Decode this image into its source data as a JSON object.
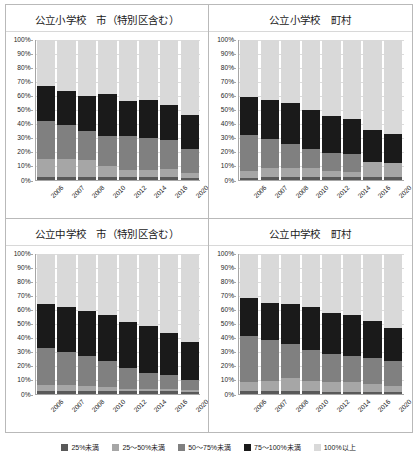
{
  "legend": {
    "items": [
      {
        "label": "25%未満",
        "color": "#595959"
      },
      {
        "label": "25～50%未満",
        "color": "#a6a6a6"
      },
      {
        "label": "50～75%未満",
        "color": "#808080"
      },
      {
        "label": "75～100%未満",
        "color": "#1a1a1a"
      },
      {
        "label": "100%以上",
        "color": "#d9d9d9"
      }
    ]
  },
  "axis": {
    "yticks": [
      "0%",
      "10%",
      "20%",
      "30%",
      "40%",
      "50%",
      "60%",
      "70%",
      "80%",
      "90%",
      "100%"
    ],
    "categories": [
      "2006",
      "2007",
      "2008",
      "2010",
      "2012",
      "2014",
      "2016",
      "2020"
    ]
  },
  "chart_data": [
    {
      "type": "bar",
      "stacked": true,
      "title": "公立小学校　市（特別区含む）",
      "xlabel": "",
      "ylabel": "",
      "ylim": [
        0,
        100
      ],
      "grid": true,
      "legend_position": "bottom",
      "categories": [
        "2006",
        "2007",
        "2008",
        "2010",
        "2012",
        "2014",
        "2016",
        "2020"
      ],
      "series": [
        {
          "name": "25%未満",
          "color": "#595959",
          "values": [
            1.5,
            2.0,
            1.5,
            1.5,
            1.5,
            1.5,
            1.5,
            1.0
          ]
        },
        {
          "name": "25～50%未満",
          "color": "#a6a6a6",
          "values": [
            13.0,
            13.0,
            12.5,
            8.0,
            5.5,
            5.0,
            6.0,
            4.0
          ]
        },
        {
          "name": "50～75%未満",
          "color": "#808080",
          "values": [
            27.0,
            24.0,
            20.5,
            21.5,
            24.0,
            23.5,
            20.5,
            17.0
          ]
        },
        {
          "name": "75～100%未満",
          "color": "#1a1a1a",
          "values": [
            25.5,
            24.5,
            25.5,
            30.0,
            25.0,
            26.5,
            25.0,
            24.0
          ]
        },
        {
          "name": "100%以上",
          "color": "#d9d9d9",
          "values": [
            33.0,
            36.5,
            40.0,
            39.0,
            44.0,
            43.5,
            47.0,
            54.0
          ]
        }
      ]
    },
    {
      "type": "bar",
      "stacked": true,
      "title": "公立小学校　町村",
      "xlabel": "",
      "ylabel": "",
      "ylim": [
        0,
        100
      ],
      "grid": true,
      "legend_position": "bottom",
      "categories": [
        "2006",
        "2007",
        "2008",
        "2010",
        "2012",
        "2014",
        "2016",
        "2020"
      ],
      "series": [
        {
          "name": "25%未満",
          "color": "#595959",
          "values": [
            1.0,
            1.5,
            1.5,
            2.0,
            2.0,
            1.5,
            1.5,
            1.5
          ]
        },
        {
          "name": "25～50%未満",
          "color": "#a6a6a6",
          "values": [
            5.0,
            7.0,
            6.5,
            6.0,
            4.0,
            4.0,
            11.0,
            10.0
          ]
        },
        {
          "name": "50～75%未満",
          "color": "#808080",
          "values": [
            25.5,
            20.5,
            17.5,
            13.5,
            13.0,
            13.0,
            0.0,
            0.0
          ]
        },
        {
          "name": "75～100%未満",
          "color": "#1a1a1a",
          "values": [
            27.5,
            28.0,
            29.0,
            28.0,
            26.5,
            24.5,
            23.0,
            21.0
          ]
        },
        {
          "name": "100%以上",
          "color": "#d9d9d9",
          "values": [
            41.0,
            43.0,
            45.5,
            50.5,
            54.5,
            57.0,
            64.5,
            67.5
          ]
        }
      ]
    },
    {
      "type": "bar",
      "stacked": true,
      "title": "公立中学校　市（特別区含む）",
      "xlabel": "",
      "ylabel": "",
      "ylim": [
        0,
        100
      ],
      "grid": true,
      "legend_position": "bottom",
      "categories": [
        "2006",
        "2007",
        "2008",
        "2010",
        "2012",
        "2014",
        "2016",
        "2020"
      ],
      "series": [
        {
          "name": "25%未満",
          "color": "#595959",
          "values": [
            1.5,
            1.5,
            1.5,
            1.5,
            1.5,
            1.5,
            1.5,
            1.0
          ]
        },
        {
          "name": "25～50%未満",
          "color": "#a6a6a6",
          "values": [
            4.5,
            4.5,
            4.0,
            3.5,
            2.0,
            2.0,
            2.0,
            1.5
          ]
        },
        {
          "name": "50～75%未満",
          "color": "#808080",
          "values": [
            26.5,
            23.5,
            21.5,
            18.5,
            15.0,
            11.5,
            10.0,
            7.5
          ]
        },
        {
          "name": "75～100%未満",
          "color": "#1a1a1a",
          "values": [
            31.5,
            32.5,
            32.0,
            32.5,
            32.5,
            33.0,
            29.5,
            27.0
          ]
        },
        {
          "name": "100%以上",
          "color": "#d9d9d9",
          "values": [
            36.0,
            38.0,
            41.0,
            44.0,
            49.0,
            52.0,
            57.0,
            63.0
          ]
        }
      ]
    },
    {
      "type": "bar",
      "stacked": true,
      "title": "公立中学校　町村",
      "xlabel": "",
      "ylabel": "",
      "ylim": [
        0,
        100
      ],
      "grid": true,
      "legend_position": "bottom",
      "categories": [
        "2006",
        "2007",
        "2008",
        "2010",
        "2012",
        "2014",
        "2016",
        "2020"
      ],
      "series": [
        {
          "name": "25%未満",
          "color": "#595959",
          "values": [
            1.5,
            1.5,
            1.5,
            1.5,
            1.0,
            1.0,
            1.0,
            1.0
          ]
        },
        {
          "name": "25～50%未満",
          "color": "#a6a6a6",
          "values": [
            6.5,
            7.5,
            9.5,
            7.5,
            7.5,
            7.0,
            5.5,
            4.5
          ]
        },
        {
          "name": "50～75%未満",
          "color": "#808080",
          "values": [
            33.0,
            29.0,
            24.5,
            22.0,
            19.5,
            19.0,
            19.0,
            17.5
          ]
        },
        {
          "name": "75～100%未満",
          "color": "#1a1a1a",
          "values": [
            27.0,
            27.0,
            28.5,
            31.0,
            29.5,
            29.0,
            26.0,
            24.0
          ]
        },
        {
          "name": "100%以上",
          "color": "#d9d9d9",
          "values": [
            32.0,
            35.0,
            36.0,
            38.0,
            42.5,
            44.0,
            48.5,
            53.0
          ]
        }
      ]
    }
  ]
}
